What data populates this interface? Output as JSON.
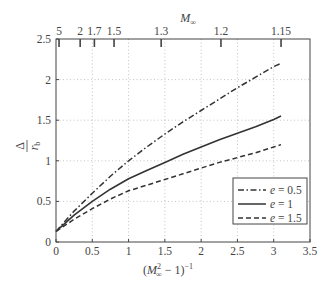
{
  "chart_data": {
    "type": "line",
    "title": "",
    "xlabel": "(M∞² − 1)⁻¹",
    "ylabel": "Δ / r_b",
    "top_xlabel": "M∞",
    "xlim": [
      0,
      3.5
    ],
    "ylim": [
      0,
      2.5
    ],
    "grid": true,
    "grid_style": "dotted",
    "legend_position": "lower right",
    "x_ticks": [
      0,
      0.5,
      1,
      1.5,
      2,
      2.5,
      3,
      3.5
    ],
    "x_tick_labels": [
      "0",
      "0.5",
      "1",
      "1.5",
      "2",
      "2.5",
      "3",
      "3.5"
    ],
    "y_ticks": [
      0,
      0.5,
      1,
      1.5,
      2,
      2.5
    ],
    "y_tick_labels": [
      "0",
      "0.5",
      "1",
      "1.5",
      "2",
      "2.5"
    ],
    "top_ticks": [
      {
        "label": "5",
        "x": 0.042
      },
      {
        "label": "2",
        "x": 0.333
      },
      {
        "label": "1.7",
        "x": 0.529
      },
      {
        "label": "1.5",
        "x": 0.8
      },
      {
        "label": "1.3",
        "x": 1.449
      },
      {
        "label": "1.2",
        "x": 2.273
      },
      {
        "label": "1.15",
        "x": 3.101
      }
    ],
    "x": [
      0,
      0.25,
      0.5,
      0.75,
      1,
      1.25,
      1.5,
      1.75,
      2,
      2.25,
      2.5,
      2.75,
      3,
      3.1
    ],
    "series": [
      {
        "name": "e = 0.5",
        "style": "dashdot",
        "values": [
          0.13,
          0.38,
          0.6,
          0.81,
          1.0,
          1.17,
          1.33,
          1.48,
          1.62,
          1.76,
          1.9,
          2.03,
          2.16,
          2.2
        ]
      },
      {
        "name": "e = 1",
        "style": "solid",
        "values": [
          0.13,
          0.33,
          0.5,
          0.65,
          0.78,
          0.88,
          0.98,
          1.08,
          1.17,
          1.26,
          1.34,
          1.42,
          1.51,
          1.55
        ]
      },
      {
        "name": "e = 1.5",
        "style": "dashed",
        "values": [
          0.13,
          0.28,
          0.41,
          0.53,
          0.63,
          0.7,
          0.77,
          0.84,
          0.91,
          0.98,
          1.04,
          1.1,
          1.17,
          1.2
        ]
      }
    ],
    "colors": {
      "line": "#333333",
      "grid": "#aaaaaa",
      "axis": "#444444"
    }
  }
}
